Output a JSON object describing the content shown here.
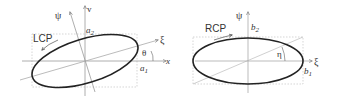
{
  "colors": {
    "ellipse": "#222222",
    "axis": "#888888",
    "box": "#bbbbbb",
    "text": "#333333"
  },
  "left_panel": {
    "polarization_label": "LCP",
    "axis_x_label": "x",
    "axis_v_label": "v",
    "axis_psi_label": "ψ",
    "axis_xi_label": "ξ",
    "angle_label": "θ",
    "semi_axis_1": {
      "base": "a",
      "sub": "1"
    },
    "semi_axis_2": {
      "base": "a",
      "sub": "2"
    }
  },
  "right_panel": {
    "polarization_label": "RCP",
    "axis_psi_label": "ψ",
    "axis_xi_label": "ξ",
    "angle_label": "η",
    "semi_axis_1": {
      "base": "b",
      "sub": "1"
    },
    "semi_axis_2": {
      "base": "b",
      "sub": "2"
    }
  }
}
